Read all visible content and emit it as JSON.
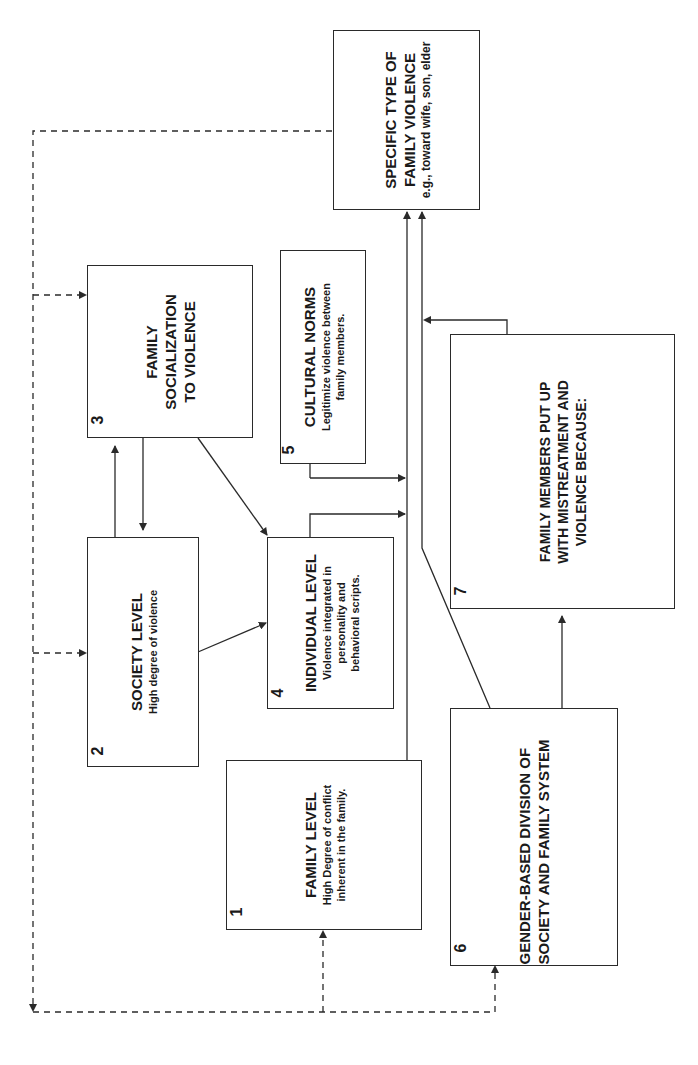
{
  "diagram": {
    "orientation": "rotated-90-ccw",
    "line_color": "#2a2a2a",
    "background": "#ffffff",
    "boxes": [
      {
        "id": 1,
        "number": "1",
        "title": "FAMILY LEVEL",
        "subtitle": "High Degree of conflict\ninherent in the family."
      },
      {
        "id": 2,
        "number": "2",
        "title": "SOCIETY LEVEL",
        "subtitle": "High degree of violence"
      },
      {
        "id": 3,
        "number": "3",
        "title": "FAMILY\nSOCIALIZATION\nTO VIOLENCE",
        "subtitle": ""
      },
      {
        "id": 4,
        "number": "4",
        "title": "INDIVIDUAL LEVEL",
        "subtitle": "Violence integrated in\npersonality and\nbehavioral scripts."
      },
      {
        "id": 5,
        "number": "5",
        "title": "CULTURAL NORMS",
        "subtitle": "Legitimize violence between\nfamily members."
      },
      {
        "id": 6,
        "number": "6",
        "title": "GENDER-BASED DIVISION OF\nSOCIETY AND FAMILY SYSTEM",
        "subtitle": ""
      },
      {
        "id": 7,
        "number": "7",
        "title": "FAMILY MEMBERS PUT UP\nWITH MISTREATMENT AND\nVIOLENCE BECAUSE:",
        "subtitle": ""
      },
      {
        "id": "outcome",
        "number": "",
        "title": "SPECIFIC TYPE OF\nFAMILY VIOLENCE",
        "subtitle": "e.g., toward wife, son, elder"
      }
    ],
    "connections": [
      {
        "from": "2",
        "to": "3",
        "style": "solid"
      },
      {
        "from": "3",
        "to": "2",
        "style": "solid"
      },
      {
        "from": "3",
        "to": "4",
        "style": "solid"
      },
      {
        "from": "2",
        "to": "4",
        "style": "solid"
      },
      {
        "from": "4",
        "to": "outcome",
        "style": "solid"
      },
      {
        "from": "5",
        "to": "outcome",
        "style": "solid"
      },
      {
        "from": "1",
        "to": "outcome",
        "style": "solid"
      },
      {
        "from": "6",
        "to": "outcome",
        "style": "solid"
      },
      {
        "from": "6",
        "to": "7",
        "style": "solid"
      },
      {
        "from": "7",
        "to": "outcome",
        "style": "solid"
      },
      {
        "from": "outcome",
        "to": "feedback",
        "style": "dashed"
      },
      {
        "from": "feedback",
        "to": "3",
        "style": "dashed"
      },
      {
        "from": "feedback",
        "to": "2",
        "style": "dashed"
      },
      {
        "from": "feedback",
        "to": "1",
        "style": "dashed"
      },
      {
        "from": "feedback",
        "to": "6",
        "style": "dashed"
      }
    ]
  }
}
